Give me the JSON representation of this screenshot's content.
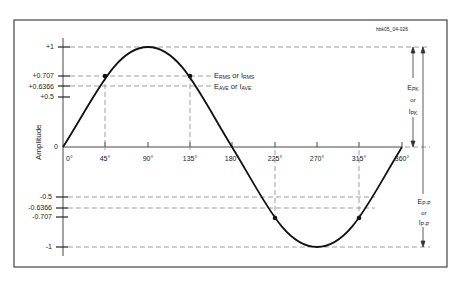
{
  "figure_id": "hbk05_04-026",
  "y_axis": {
    "label": "Amplitude",
    "ticks": [
      "+1",
      "+0.707",
      "+0.6366",
      "+0.5",
      "0",
      "-0.5",
      "-0.6366",
      "-0.707",
      "-1"
    ]
  },
  "x_axis": {
    "ticks": [
      "0°",
      "45°",
      "90°",
      "135°",
      "180°",
      "225°",
      "270°",
      "315°",
      "360°"
    ]
  },
  "annotations": {
    "rms": {
      "e": "E",
      "e_sub": "RMS",
      "or": "or",
      "i": "I",
      "i_sub": "RMS"
    },
    "ave": {
      "e": "E",
      "e_sub": "AVE",
      "or": "or",
      "i": "I",
      "i_sub": "AVE"
    },
    "peak": {
      "e": "E",
      "e_sub": "PK",
      "or": "or",
      "i": "I",
      "i_sub": "PK"
    },
    "peak_to_peak": {
      "e": "E",
      "e_sub": "P-P",
      "or": "or",
      "i": "I",
      "i_sub": "P-P"
    }
  }
}
